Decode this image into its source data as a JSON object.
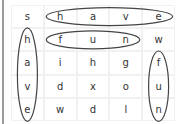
{
  "puzzle": {
    "rows": [
      [
        "s",
        "h",
        "a",
        "v",
        "e"
      ],
      [
        "h",
        "f",
        "u",
        "n",
        "w"
      ],
      [
        "a",
        "i",
        "h",
        "g",
        "f"
      ],
      [
        "v",
        "d",
        "x",
        "o",
        "u"
      ],
      [
        "e",
        "w",
        "d",
        "l",
        "n"
      ]
    ],
    "found_words": [
      {
        "word": "have",
        "direction": "horizontal",
        "start": [
          0,
          1
        ],
        "end": [
          0,
          4
        ]
      },
      {
        "word": "fun",
        "direction": "horizontal",
        "start": [
          1,
          1
        ],
        "end": [
          1,
          3
        ]
      },
      {
        "word": "have",
        "direction": "vertical",
        "start": [
          1,
          0
        ],
        "end": [
          4,
          0
        ]
      },
      {
        "word": "fun",
        "direction": "vertical",
        "start": [
          2,
          4
        ],
        "end": [
          4,
          4
        ]
      }
    ],
    "circle_color": "#444444"
  }
}
